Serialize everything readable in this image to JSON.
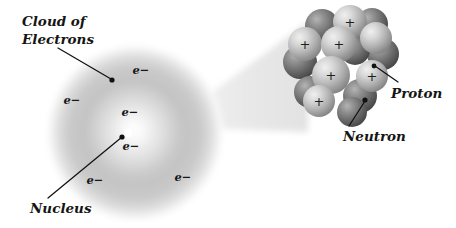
{
  "figure": {
    "background_color": "#ffffff",
    "width": 456,
    "height": 228
  },
  "labels": {
    "cloud_line1": "Cloud of",
    "cloud_line2": "Electrons",
    "nucleus": "Nucleus",
    "proton": "Proton",
    "neutron": "Neutron"
  },
  "electron_symbol": "e−",
  "proton_symbol": "+",
  "electron_cloud": {
    "center_x": 135,
    "center_y": 133,
    "radius": 88,
    "core_color": "#f2f2f2",
    "mid_color": "#c9c9c9",
    "edge_color": "#ffffff",
    "nucleus_dot_color": "#ffffff"
  },
  "electron_positions": [
    {
      "x": 141,
      "y": 74
    },
    {
      "x": 72,
      "y": 104
    },
    {
      "x": 130,
      "y": 116
    },
    {
      "x": 131,
      "y": 150
    },
    {
      "x": 95,
      "y": 184
    },
    {
      "x": 183,
      "y": 181
    }
  ],
  "magnifier_cone": {
    "color": "#e8e8e8",
    "from_x": 196,
    "to_x": 308
  },
  "nucleus_detail": {
    "proton_color_light": "#d8d8d8",
    "proton_color_dark": "#8e8e8e",
    "neutron_color_light": "#9a9a9a",
    "neutron_color_dark": "#4a4a4a",
    "particles": [
      {
        "type": "neutron",
        "x": 322,
        "y": 26,
        "r": 17
      },
      {
        "type": "neutron",
        "x": 372,
        "y": 24,
        "r": 16
      },
      {
        "type": "neutron",
        "x": 300,
        "y": 62,
        "r": 17
      },
      {
        "type": "neutron",
        "x": 383,
        "y": 54,
        "r": 16
      },
      {
        "type": "neutron",
        "x": 310,
        "y": 92,
        "r": 16
      },
      {
        "type": "neutron",
        "x": 355,
        "y": 50,
        "r": 15
      },
      {
        "type": "neutron",
        "x": 360,
        "y": 96,
        "r": 17
      },
      {
        "type": "proton",
        "x": 350,
        "y": 22,
        "r": 17
      },
      {
        "type": "proton",
        "x": 305,
        "y": 44,
        "r": 17
      },
      {
        "type": "proton",
        "x": 339,
        "y": 44,
        "r": 18
      },
      {
        "type": "proton",
        "x": 376,
        "y": 38,
        "r": 16
      },
      {
        "type": "proton",
        "x": 331,
        "y": 75,
        "r": 19
      },
      {
        "type": "proton",
        "x": 372,
        "y": 76,
        "r": 16
      },
      {
        "type": "proton",
        "x": 319,
        "y": 101,
        "r": 16
      }
    ]
  },
  "leader_lines": {
    "cloud": {
      "x1": 58,
      "y1": 48,
      "x2": 111,
      "y2": 79
    },
    "nucleus": {
      "x1": 48,
      "y1": 198,
      "x2": 122,
      "y2": 137
    },
    "proton": {
      "x1": 398,
      "y1": 82,
      "x2": 374,
      "y2": 66
    },
    "neutron": {
      "x1": 349,
      "y1": 126,
      "x2": 365,
      "y2": 101
    }
  }
}
